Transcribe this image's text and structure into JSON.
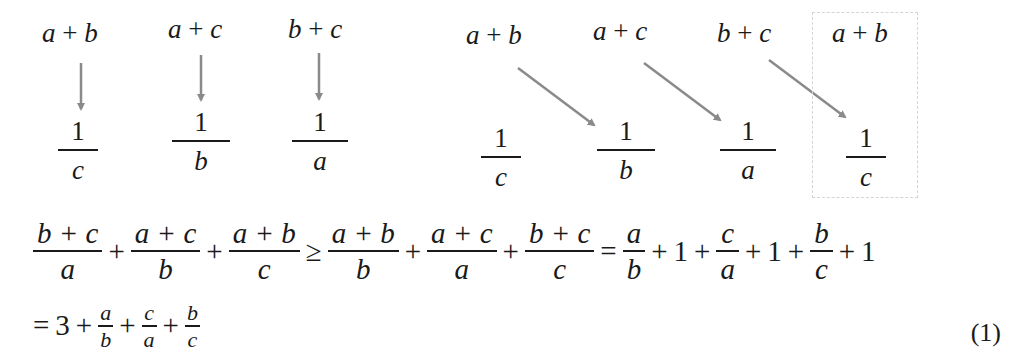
{
  "diagram_left": {
    "numerators": [
      {
        "left": "a",
        "op": "+",
        "right": "b"
      },
      {
        "left": "a",
        "op": "+",
        "right": "c"
      },
      {
        "left": "b",
        "op": "+",
        "right": "c"
      }
    ],
    "fractions": [
      {
        "num": "1",
        "den": "c"
      },
      {
        "num": "1",
        "den": "b"
      },
      {
        "num": "1",
        "den": "a"
      }
    ]
  },
  "diagram_right": {
    "numerators": [
      {
        "left": "a",
        "op": "+",
        "right": "b"
      },
      {
        "left": "a",
        "op": "+",
        "right": "c"
      },
      {
        "left": "b",
        "op": "+",
        "right": "c"
      },
      {
        "left": "a",
        "op": "+",
        "right": "b"
      }
    ],
    "fractions": [
      {
        "num": "1",
        "den": "c"
      },
      {
        "num": "1",
        "den": "b"
      },
      {
        "num": "1",
        "den": "a"
      },
      {
        "num": "1",
        "den": "c"
      }
    ]
  },
  "equation": {
    "line1": {
      "lhs": [
        {
          "num": "b + c",
          "den": "a"
        },
        {
          "num": "a + c",
          "den": "b"
        },
        {
          "num": "a + b",
          "den": "c"
        }
      ],
      "plus": "+",
      "geq": "≥",
      "mid": [
        {
          "num": "a + b",
          "den": "b"
        },
        {
          "num": "a + c",
          "den": "a"
        },
        {
          "num": "b + c",
          "den": "c"
        }
      ],
      "eq": "=",
      "rhs": [
        {
          "num": "a",
          "den": "b"
        },
        {
          "num": "c",
          "den": "a"
        },
        {
          "num": "b",
          "den": "c"
        }
      ],
      "one": "1"
    },
    "line2": {
      "eq": "=",
      "three": "3",
      "plus": "+",
      "terms": [
        {
          "num": "a",
          "den": "b"
        },
        {
          "num": "c",
          "den": "a"
        },
        {
          "num": "b",
          "den": "c"
        }
      ]
    },
    "number": "(1)"
  },
  "colors": {
    "arrow": "#8a8a8a",
    "text": "#1a1a1a",
    "box_border": "#d4d4d4"
  }
}
